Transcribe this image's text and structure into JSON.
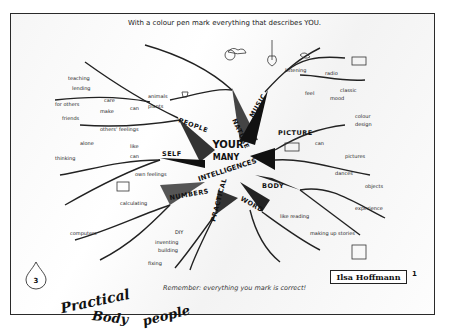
{
  "worksheet": {
    "instruction": "With a colour pen mark everything that describes YOU.",
    "reminder": "Remember: everything you mark is correct!",
    "center_title": [
      "YOUR",
      "MANY",
      "INTELLIGENCES"
    ],
    "publisher_name": "Ilsa Hoffmann",
    "page_number": "1",
    "sheet_badge": "3",
    "handwritten_notes": [
      "Practical",
      "Body",
      "people"
    ]
  },
  "branches": [
    {
      "name": "PEOPLE",
      "leaves": [
        "teaching",
        "lending",
        "for others",
        "care",
        "friends",
        "make",
        "can",
        "others' feelings",
        "like"
      ]
    },
    {
      "name": "NATURE",
      "leaves": [
        "animals",
        "plants",
        "grow",
        "like",
        "can"
      ]
    },
    {
      "name": "MUSIC",
      "leaves": [
        "instruments",
        "play",
        "listening",
        "radio",
        "like",
        "can",
        "sing",
        "feel",
        "mood",
        "classic"
      ]
    },
    {
      "name": "PICTURE",
      "leaves": [
        "like",
        "drawing",
        "colour",
        "design",
        "can",
        "see",
        "pictures"
      ]
    },
    {
      "name": "BODY",
      "leaves": [
        "like",
        "sport",
        "dances",
        "objects",
        "experience"
      ]
    },
    {
      "name": "WORD",
      "leaves": [
        "like reading",
        "making up stories",
        "poems",
        "can speak",
        "read"
      ]
    },
    {
      "name": "PRACTICAL",
      "leaves": [
        "DIY",
        "inventing",
        "building",
        "fixing",
        "like"
      ]
    },
    {
      "name": "NUMBERS",
      "leaves": [
        "like",
        "calculating",
        "computers",
        "logic",
        "solving"
      ]
    },
    {
      "name": "SELF",
      "leaves": [
        "alone",
        "like",
        "can",
        "know",
        "own feelings",
        "thinking",
        "self"
      ]
    }
  ],
  "colors": {
    "ink": "#111111",
    "border": "#2a2a2a",
    "paper": "#ffffff"
  }
}
